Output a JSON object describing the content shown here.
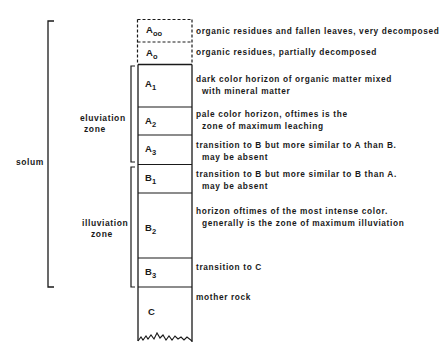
{
  "brackets": {
    "solum": "solum",
    "eluviation": [
      "eluviation",
      "zone"
    ],
    "illuviation": [
      "illuviation",
      "zone"
    ]
  },
  "horizons": [
    {
      "letter": "A",
      "sub": "oo",
      "desc1": "organic residues and fallen leaves, very decomposed",
      "desc2": ""
    },
    {
      "letter": "A",
      "sub": "o",
      "desc1": "organic residues, partially decomposed",
      "desc2": ""
    },
    {
      "letter": "A",
      "sub": "1",
      "desc1": "dark color horizon of organic matter mixed",
      "desc2": "with mineral matter"
    },
    {
      "letter": "A",
      "sub": "2",
      "desc1": "pale color horizon, oftimes is the",
      "desc2": "zone of maximum leaching"
    },
    {
      "letter": "A",
      "sub": "3",
      "desc1": "transition to B but more similar to A than B.",
      "desc2": "may be absent"
    },
    {
      "letter": "B",
      "sub": "1",
      "desc1": "transition to B but more similar to B than A.",
      "desc2": "may be absent"
    },
    {
      "letter": "B",
      "sub": "2",
      "desc1": "horizon oftimes of the most intense color.",
      "desc2": "generally is the zone of maximum illuviation"
    },
    {
      "letter": "B",
      "sub": "3",
      "desc1": "transition to C",
      "desc2": ""
    },
    {
      "letter": "C",
      "sub": "",
      "desc1": "mother rock",
      "desc2": ""
    }
  ]
}
